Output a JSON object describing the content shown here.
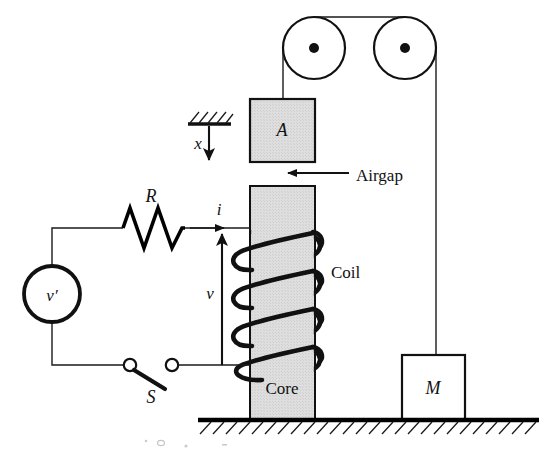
{
  "figure": {
    "background_color": "#ffffff",
    "line_color": "#111111",
    "fill_core": "#dcdcdc",
    "fill_block_a": "#dcdcdc",
    "fill_mass_m": "#ffffff"
  },
  "labels": {
    "armature": "A",
    "mass": "M",
    "core": "Core",
    "coil": "Coil",
    "airgap": "Airgap",
    "resistor": "R",
    "source": "v′",
    "current": "i",
    "voltage": "v",
    "switch": "S",
    "displacement": "x"
  },
  "components": {
    "pulleys": [
      {
        "name": "left-pulley",
        "cx": 314,
        "cy": 48,
        "r": 31,
        "hub_r": 5
      },
      {
        "name": "right-pulley",
        "cx": 405,
        "cy": 48,
        "r": 31,
        "hub_r": 5
      }
    ],
    "block_a": {
      "x": 250,
      "y": 99,
      "w": 65,
      "h": 63,
      "fill": "#dcdcdc"
    },
    "core": {
      "x": 250,
      "y": 186,
      "w": 65,
      "h": 234,
      "fill": "#dcdcdc"
    },
    "mass_m": {
      "x": 402,
      "y": 355,
      "w": 63,
      "h": 65,
      "fill": "#ffffff"
    },
    "ground": {
      "y": 420,
      "x1": 198,
      "x2": 539
    },
    "ceiling_support": {
      "x1": 188,
      "x2": 230,
      "y": 124
    },
    "source": {
      "cx": 52,
      "cy": 294,
      "r": 28
    },
    "resistor": {
      "x1": 123,
      "x2": 185,
      "y": 228,
      "zigzags": 4
    },
    "switch": {
      "left_cx": 130,
      "right_cx": 172,
      "cy": 365,
      "r": 6
    },
    "coil": {
      "turns": 4,
      "top": 228,
      "bottom": 372,
      "left": 243,
      "right": 322
    },
    "airgap_arrow": {
      "from_x": 348,
      "to_x": 285,
      "y": 173
    },
    "x_arrow": {
      "x": 209,
      "from_y": 128,
      "to_y": 170
    },
    "v_arrow": {
      "x": 222,
      "from_y": 365,
      "to_y": 224
    },
    "i_arrow": {
      "y": 228,
      "from_x": 185,
      "to_x": 228
    }
  },
  "label_positions": {
    "armature": {
      "x": 282,
      "y": 136
    },
    "mass": {
      "x": 433,
      "y": 394
    },
    "core": {
      "x": 282,
      "y": 394
    },
    "coil": {
      "x": 331,
      "y": 278
    },
    "airgap": {
      "x": 356,
      "y": 180
    },
    "resistor": {
      "x": 151,
      "y": 201
    },
    "source": {
      "x": 52,
      "y": 300
    },
    "current": {
      "x": 218,
      "y": 214
    },
    "voltage": {
      "x": 210,
      "y": 298
    },
    "switch": {
      "x": 151,
      "y": 402
    },
    "displacement": {
      "x": 198,
      "y": 148
    }
  }
}
